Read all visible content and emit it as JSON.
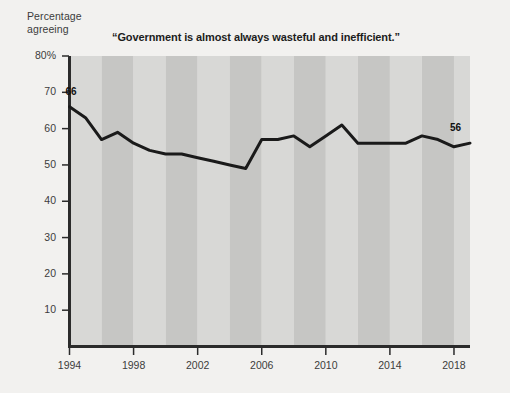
{
  "axis_caption": {
    "line1": "Percentage",
    "line2": "agreeing"
  },
  "title": "“Government is almost always wasteful and inefficient.”",
  "labels": {
    "start_value": "66",
    "end_value": "56"
  },
  "colors": {
    "background": "#f2f1ef",
    "plot_band_light": "#d8d8d6",
    "plot_band_dark": "#c6c6c4",
    "line": "#1a1a1a",
    "axis": "#2b2b2b",
    "text": "#3c3c3c"
  },
  "chart_data": {
    "type": "line",
    "title": "“Government is almost always wasteful and inefficient.”",
    "xlabel": "",
    "ylabel": "Percentage agreeing",
    "ylim": [
      0,
      80
    ],
    "xlim": [
      1994,
      2019
    ],
    "grid": false,
    "legend": null,
    "yticks": [
      80,
      70,
      60,
      50,
      40,
      30,
      20,
      10
    ],
    "ytick_labels": [
      "80%",
      "70",
      "60",
      "50",
      "40",
      "30",
      "20",
      "10"
    ],
    "xticks": [
      1994,
      1998,
      2002,
      2006,
      2010,
      2014,
      2018
    ],
    "xtick_labels": [
      "1994",
      "1998",
      "2002",
      "2006",
      "2010",
      "2014",
      "2018"
    ],
    "background_bands": "alternating vertical light/dark stripes, ~2-year width",
    "annotations": [
      {
        "x": 1994,
        "y": 66,
        "text": "66",
        "position": "above"
      },
      {
        "x": 2019,
        "y": 56,
        "text": "56",
        "position": "above"
      }
    ],
    "x": [
      1994,
      1995,
      1996,
      1997,
      1998,
      1999,
      2000,
      2001,
      2002,
      2003,
      2004,
      2005,
      2006,
      2007,
      2008,
      2009,
      2010,
      2011,
      2012,
      2013,
      2014,
      2015,
      2016,
      2017,
      2018,
      2019
    ],
    "values": [
      66,
      63,
      57,
      59,
      56,
      54,
      53,
      53,
      52,
      51,
      50,
      49,
      57,
      57,
      58,
      55,
      58,
      61,
      56,
      56,
      56,
      56,
      58,
      57,
      55,
      56
    ],
    "series": [
      {
        "name": "Percentage agreeing",
        "values": [
          66,
          63,
          57,
          59,
          56,
          54,
          53,
          53,
          52,
          51,
          50,
          49,
          57,
          57,
          58,
          55,
          58,
          61,
          56,
          56,
          56,
          56,
          58,
          57,
          55,
          56
        ]
      }
    ]
  }
}
